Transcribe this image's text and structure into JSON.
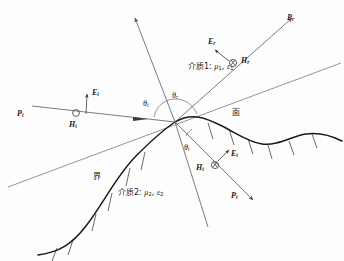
{
  "figure": {
    "origin": {
      "x": 175,
      "y": 122
    }
  },
  "media": {
    "upper": {
      "name": "介质1",
      "sep": ":",
      "mu": "μ",
      "mu_sub": "1",
      "eps": "ε",
      "eps_sub": "1",
      "comma": ",",
      "text": "介质1: μ1, ε1"
    },
    "lower": {
      "name": "介质2",
      "sep": ":",
      "mu": "μ",
      "mu_sub": "2",
      "eps": "ε",
      "eps_sub": "2",
      "comma": ",",
      "text": "介质2: μ2, ε2"
    }
  },
  "interface": {
    "label_left": "界",
    "label_right": "面",
    "full_label": "界面"
  },
  "vectors": {
    "incident": {
      "poynting": {
        "sym": "P",
        "sub": "i"
      },
      "efield": {
        "sym": "E",
        "sub": "i"
      },
      "hfield": {
        "sym": "H",
        "sub": "i"
      }
    },
    "reflected": {
      "poynting": {
        "sym": "P",
        "sub": "r"
      },
      "efield": {
        "sym": "E",
        "sub": "r"
      },
      "hfield": {
        "sym": "H",
        "sub": "r"
      }
    },
    "transmitted": {
      "poynting": {
        "sym": "P",
        "sub": "t"
      },
      "efield": {
        "sym": "E",
        "sub": "t"
      },
      "hfield": {
        "sym": "H",
        "sub": "t"
      }
    }
  },
  "angles": {
    "incidence": {
      "sym": "θ",
      "sub": "i"
    },
    "reflection": {
      "sym": "θ",
      "sub": "r"
    },
    "transmission": {
      "sym": "θ",
      "sub": "t"
    }
  },
  "colors": {
    "ray": "#5a5a60",
    "curve": "#1a1a1a",
    "text": "#1c1c1c",
    "background": "#fdfdfd"
  }
}
